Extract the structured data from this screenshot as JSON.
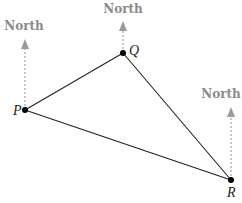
{
  "diagram": {
    "type": "bearing-triangle",
    "points": [
      {
        "id": "P",
        "label": "P",
        "x": 25,
        "y": 110
      },
      {
        "id": "Q",
        "label": "Q",
        "x": 123,
        "y": 53
      },
      {
        "id": "R",
        "label": "R",
        "x": 231,
        "y": 180
      }
    ],
    "edges": [
      [
        "P",
        "Q"
      ],
      [
        "Q",
        "R"
      ],
      [
        "P",
        "R"
      ]
    ],
    "north_label": "North",
    "north_arrows": [
      {
        "at": "P",
        "label": "North"
      },
      {
        "at": "Q",
        "label": "North"
      },
      {
        "at": "R",
        "label": "North"
      }
    ],
    "colors": {
      "line": "#222222",
      "north": "#9a9a9a",
      "point": "#000000"
    }
  }
}
